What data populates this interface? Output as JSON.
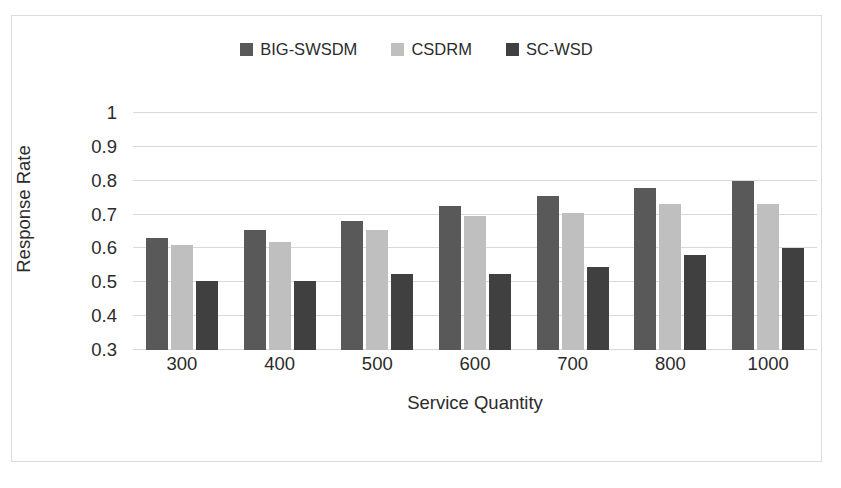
{
  "chart_data": {
    "type": "bar",
    "title": "",
    "xlabel": "Service Quantity",
    "ylabel": "Response Rate",
    "categories": [
      "300",
      "400",
      "500",
      "600",
      "700",
      "800",
      "1000"
    ],
    "series": [
      {
        "name": "BIG-SWSDM",
        "color": "#595959",
        "values": [
          0.63,
          0.655,
          0.68,
          0.725,
          0.755,
          0.78,
          0.8
        ]
      },
      {
        "name": "CSDRM",
        "color": "#bfbfbf",
        "values": [
          0.61,
          0.62,
          0.655,
          0.695,
          0.705,
          0.73,
          0.73
        ]
      },
      {
        "name": "SC-WSD",
        "color": "#404040",
        "values": [
          0.505,
          0.505,
          0.525,
          0.525,
          0.545,
          0.58,
          0.6
        ]
      }
    ],
    "ylim": [
      0.3,
      1.0
    ],
    "yticks": [
      "0.3",
      "0.4",
      "0.5",
      "0.6",
      "0.7",
      "0.8",
      "0.9",
      "1"
    ],
    "ytick_values": [
      0.3,
      0.4,
      0.5,
      0.6,
      0.7,
      0.8,
      0.9,
      1.0
    ],
    "grid": "horizontal",
    "gridline_color": "#d9d9d9",
    "legend_position": "top-center",
    "background_color": "#ffffff",
    "border_color": "#dcdcdc"
  }
}
